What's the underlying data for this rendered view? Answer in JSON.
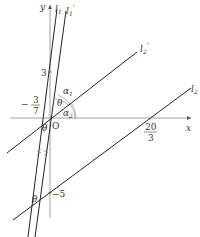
{
  "diagram": {
    "axes": {
      "x_label": "x",
      "y_label": "y",
      "origin_label": "O"
    },
    "lines": {
      "l1": {
        "name": "l",
        "sub": "1",
        "prime": ""
      },
      "l1p": {
        "name": "l",
        "sub": "1",
        "prime": "′"
      },
      "l2": {
        "name": "l",
        "sub": "2",
        "prime": ""
      },
      "l2p": {
        "name": "l",
        "sub": "2",
        "prime": "′"
      }
    },
    "ticks": {
      "y_pos": "3",
      "y_neg": "−5",
      "x_neg_num": "3",
      "x_neg_den": "7",
      "x_neg_sign": "−",
      "x_pos_num": "20",
      "x_pos_den": "3"
    },
    "angles": {
      "alpha1": {
        "name": "α",
        "sub": "1"
      },
      "alpha2": {
        "name": "α",
        "sub": "2"
      },
      "theta": "θ",
      "theta_lower1": "θ",
      "theta_lower2": "θ"
    },
    "colors": {
      "axis": "#777777",
      "line": "#222222",
      "text": "#333333"
    }
  }
}
